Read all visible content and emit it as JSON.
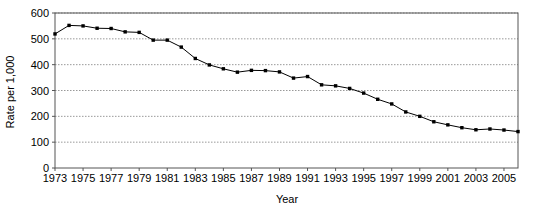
{
  "chart_data": {
    "type": "line",
    "title": "",
    "xlabel": "Year",
    "ylabel": "Rate per 1,000",
    "xlim": [
      1973,
      2006
    ],
    "ylim": [
      0,
      600
    ],
    "grid": true,
    "grid_axis": "y",
    "legend": "none",
    "marker": "filled-square",
    "line_color": "#000000",
    "marker_color": "#000000",
    "grid_color": "#999999",
    "axis_color": "#555555",
    "background": "#ffffff",
    "ytick_labels": [
      "0",
      "100",
      "200",
      "300",
      "400",
      "500",
      "600"
    ],
    "ytick_values": [
      0,
      100,
      200,
      300,
      400,
      500,
      600
    ],
    "xtick_labels": [
      "1973",
      "1975",
      "1977",
      "1979",
      "1981",
      "1983",
      "1985",
      "1987",
      "1989",
      "1991",
      "1993",
      "1995",
      "1997",
      "1999",
      "2001",
      "2003",
      "2005"
    ],
    "xtick_values": [
      1973,
      1975,
      1977,
      1979,
      1981,
      1983,
      1985,
      1987,
      1989,
      1991,
      1993,
      1995,
      1997,
      1999,
      2001,
      2003,
      2005
    ],
    "x": [
      1973,
      1974,
      1975,
      1976,
      1977,
      1978,
      1979,
      1980,
      1981,
      1982,
      1983,
      1984,
      1985,
      1986,
      1987,
      1988,
      1989,
      1990,
      1991,
      1992,
      1993,
      1994,
      1995,
      1996,
      1997,
      1998,
      1999,
      2000,
      2001,
      2002,
      2003,
      2004,
      2005,
      2006
    ],
    "values": [
      519,
      552,
      550,
      541,
      540,
      527,
      525,
      495,
      495,
      468,
      424,
      399,
      384,
      371,
      378,
      377,
      372,
      348,
      354,
      322,
      318,
      308,
      290,
      266,
      248,
      217,
      200,
      179,
      167,
      156,
      148,
      151,
      147,
      141
    ],
    "annotations": []
  }
}
